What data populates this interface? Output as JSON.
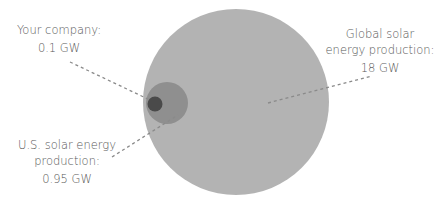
{
  "diagram": {
    "type": "nested-circles",
    "colors": {
      "global": "#b3b3b3",
      "us": "#8f8f8f",
      "company": "#4a4a4a",
      "leader": "#8a8a8a",
      "text": "#595959"
    },
    "items": [
      {
        "id": "company",
        "line1": "Your company:",
        "value": "0.1 GW"
      },
      {
        "id": "global",
        "line1": "Global solar",
        "line2": "energy production:",
        "value": "18 GW"
      },
      {
        "id": "us",
        "line1": "U.S. solar energy",
        "line2": "production:",
        "value": "0.95 GW"
      }
    ]
  }
}
